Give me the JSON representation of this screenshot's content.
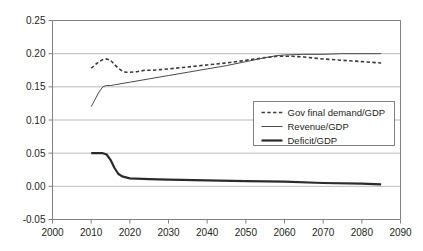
{
  "chart_data": {
    "type": "line",
    "title": "",
    "subtitle": "",
    "xlabel": "",
    "ylabel": "",
    "xlim": [
      2000,
      2090
    ],
    "ylim": [
      -0.05,
      0.25
    ],
    "xticks": [
      2000,
      2010,
      2020,
      2030,
      2040,
      2050,
      2060,
      2070,
      2080,
      2090
    ],
    "xtick_labels": [
      "2000",
      "2010",
      "2020",
      "2030",
      "2040",
      "2050",
      "2060",
      "2070",
      "2080",
      "2090"
    ],
    "yticks": [
      -0.05,
      0.0,
      0.05,
      0.1,
      0.15,
      0.2,
      0.25
    ],
    "ytick_labels": [
      "-0.05",
      "0.00",
      "0.05",
      "0.10",
      "0.15",
      "0.20",
      "0.25"
    ],
    "grid": "horizontal",
    "legend_position": "center-right-below",
    "series": [
      {
        "name": "Gov final demand/GDP",
        "style": "dashed",
        "color": "#3a3a3a",
        "width": 1.6,
        "x": [
          2010,
          2011,
          2012,
          2013,
          2014,
          2015,
          2016,
          2017,
          2018,
          2019,
          2020,
          2022,
          2024,
          2026,
          2028,
          2030,
          2035,
          2040,
          2045,
          2050,
          2055,
          2058,
          2060,
          2062,
          2065,
          2070,
          2075,
          2080,
          2085
        ],
        "values": [
          0.178,
          0.183,
          0.188,
          0.191,
          0.192,
          0.19,
          0.184,
          0.178,
          0.174,
          0.172,
          0.172,
          0.173,
          0.175,
          0.175,
          0.176,
          0.177,
          0.18,
          0.183,
          0.186,
          0.19,
          0.194,
          0.196,
          0.196,
          0.196,
          0.195,
          0.192,
          0.19,
          0.188,
          0.186
        ]
      },
      {
        "name": "Revenue/GDP",
        "style": "solid",
        "color": "#4a4a4a",
        "width": 1.0,
        "x": [
          2010,
          2011,
          2012,
          2013,
          2014,
          2015,
          2016,
          2018,
          2020,
          2025,
          2030,
          2035,
          2040,
          2045,
          2050,
          2055,
          2058,
          2060,
          2065,
          2070,
          2075,
          2080,
          2085
        ],
        "values": [
          0.12,
          0.131,
          0.142,
          0.15,
          0.152,
          0.152,
          0.153,
          0.155,
          0.157,
          0.162,
          0.167,
          0.172,
          0.177,
          0.182,
          0.188,
          0.194,
          0.197,
          0.198,
          0.199,
          0.199,
          0.2,
          0.2,
          0.2
        ]
      },
      {
        "name": "Deficit/GDP",
        "style": "solid",
        "color": "#2b2b2b",
        "width": 2.2,
        "x": [
          2010,
          2011,
          2012,
          2013,
          2014,
          2015,
          2016,
          2017,
          2018,
          2020,
          2025,
          2030,
          2040,
          2050,
          2060,
          2070,
          2080,
          2085
        ],
        "values": [
          0.05,
          0.05,
          0.05,
          0.05,
          0.048,
          0.04,
          0.028,
          0.019,
          0.015,
          0.012,
          0.011,
          0.01,
          0.009,
          0.008,
          0.007,
          0.005,
          0.004,
          0.003
        ]
      }
    ]
  },
  "legend": {
    "items": [
      {
        "label": "Gov final demand/GDP",
        "style": "dashed"
      },
      {
        "label": "Revenue/GDP",
        "style": "thin"
      },
      {
        "label": "Deficit/GDP",
        "style": "thick"
      }
    ]
  },
  "colors": {
    "axis": "#808080",
    "grid": "#a9a9a9",
    "text": "#231f20",
    "background": "#ffffff",
    "legend_border": "#808080"
  }
}
